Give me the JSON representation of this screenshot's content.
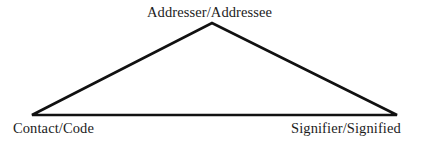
{
  "diagram": {
    "type": "triangle-model",
    "background_color": "#ffffff",
    "line_color": "#111111",
    "text_color": "#1c1c1c",
    "line_width_px": 2.6,
    "vertices": [
      {
        "id": "apex",
        "label": "Addresser/Addressee",
        "x": 212,
        "y": 23
      },
      {
        "id": "bottom-left",
        "label": "Contact/Code",
        "x": 32,
        "y": 115
      },
      {
        "id": "bottom-right",
        "label": "Signifier/Signified",
        "x": 397,
        "y": 115
      }
    ],
    "edges": [
      {
        "from": "bottom-left",
        "to": "apex"
      },
      {
        "from": "apex",
        "to": "bottom-right"
      },
      {
        "from": "bottom-left",
        "to": "bottom-right"
      }
    ],
    "labels": {
      "apex": "Addresser/Addressee",
      "bottom_left": "Contact/Code",
      "bottom_right": "Signifier/Signified"
    }
  }
}
